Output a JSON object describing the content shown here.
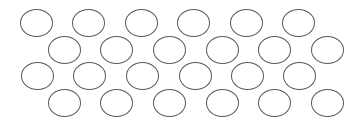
{
  "canvas": {
    "width": 362,
    "height": 125,
    "background": "#ffffff"
  },
  "style": {
    "stroke": "#5a5a5a",
    "ellipse_width": 33,
    "ellipse_height": 28
  },
  "rows": [
    {
      "name": "row-1",
      "y": 9,
      "x": [
        20,
        72,
        125,
        177,
        230,
        282
      ]
    },
    {
      "name": "row-2",
      "y": 36,
      "x": [
        48,
        100,
        153,
        206,
        258,
        311
      ]
    },
    {
      "name": "row-3",
      "y": 62,
      "x": [
        21,
        73,
        126,
        179,
        231,
        283
      ]
    },
    {
      "name": "row-4",
      "y": 89,
      "x": [
        48,
        100,
        153,
        206,
        258,
        311
      ]
    }
  ]
}
